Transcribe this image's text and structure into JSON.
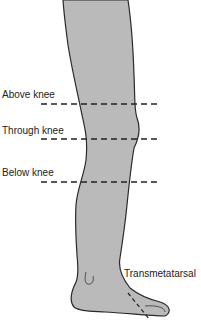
{
  "figure": {
    "fill_color": "#b9b9b9",
    "outline_color": "#2a2a2a",
    "labels": {
      "above_knee": "Above knee",
      "through_knee": "Through knee",
      "below_knee": "Below knee",
      "transmetatarsal": "Transmetatarsal"
    }
  }
}
